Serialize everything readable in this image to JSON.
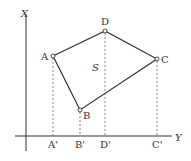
{
  "diagram": {
    "axes": {
      "vertical_label": "X",
      "horizontal_label": "Y"
    },
    "area_label": "S",
    "points": [
      {
        "name": "A",
        "x": 53,
        "y": 56
      },
      {
        "name": "B",
        "x": 80,
        "y": 110
      },
      {
        "name": "C",
        "x": 157,
        "y": 59
      },
      {
        "name": "D",
        "x": 105,
        "y": 31
      }
    ],
    "projections": [
      {
        "name": "A'",
        "of": "A"
      },
      {
        "name": "B'",
        "of": "B"
      },
      {
        "name": "D'",
        "of": "D"
      },
      {
        "name": "C'",
        "of": "C"
      }
    ],
    "polygon_order": [
      "A",
      "D",
      "C",
      "B"
    ],
    "colors": {
      "stroke": "#333333",
      "dashed": "#666666",
      "background": "#ffffff"
    }
  }
}
